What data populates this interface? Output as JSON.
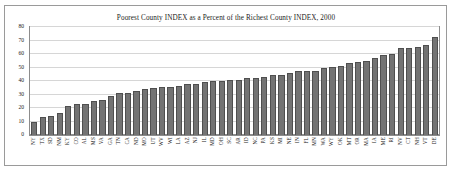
{
  "chart_data": {
    "type": "bar",
    "title": "Poorest County INDEX as a Percent of the Richest County INDEX, 2000",
    "xlabel": "",
    "ylabel": "",
    "ylim": [
      0,
      80
    ],
    "yticks": [
      0,
      10,
      20,
      30,
      40,
      50,
      60,
      70,
      80
    ],
    "grid": true,
    "legend": "none",
    "bar_color": "#737373",
    "bar_edge_color": "#4f4f4f",
    "grid_color": "#d6d6d6",
    "frame_color": "#8c8c8c",
    "categories": [
      "NY",
      "TX",
      "SD",
      "NM",
      "KY",
      "CO",
      "AL",
      "MS",
      "VA",
      "GA",
      "TN",
      "CA",
      "ND",
      "MO",
      "UT",
      "WV",
      "WI",
      "LA",
      "AZ",
      "NJ",
      "IL",
      "MD",
      "OH",
      "SC",
      "AR",
      "ID",
      "NC",
      "PA",
      "KS",
      "MI",
      "NE",
      "IN",
      "FL",
      "MN",
      "WA",
      "WY",
      "OK",
      "MT",
      "OR",
      "MA",
      "IA",
      "ME",
      "RI",
      "NV",
      "CT",
      "NH",
      "VT",
      "DE"
    ],
    "values": [
      9.8,
      13.5,
      13.8,
      16.6,
      21.7,
      22.7,
      22.8,
      25.2,
      25.9,
      28.6,
      31.3,
      31.2,
      32.9,
      34.1,
      34.7,
      35.6,
      35.8,
      36.6,
      37.7,
      37.9,
      39.2,
      39.7,
      39.8,
      40.7,
      40.8,
      42.0,
      42.3,
      43.3,
      44.8,
      44.7,
      45.9,
      47.2,
      47.3,
      47.6,
      50.0,
      50.4,
      51.0,
      53.6,
      53.8,
      54.5,
      56.7,
      59.2,
      60.3,
      64.3,
      64.2,
      64.9,
      66.4,
      72.8
    ]
  }
}
